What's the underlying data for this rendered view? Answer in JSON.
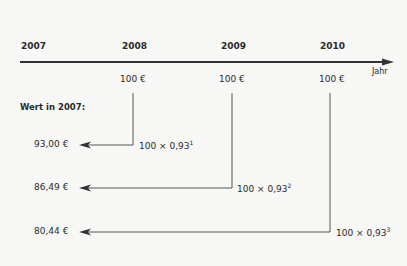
{
  "timeline": {
    "axis_label": "Jahr",
    "years": [
      "2007",
      "2008",
      "2009",
      "2010"
    ],
    "payments": [
      "100 €",
      "100 €",
      "100 €"
    ]
  },
  "present_value": {
    "heading": "Wert in 2007:",
    "values": [
      "93,00 €",
      "86,49 €",
      "80,44 €"
    ],
    "formulas": [
      {
        "base": "100 × 0,93",
        "exp": "1"
      },
      {
        "base": "100 × 0,93",
        "exp": "2"
      },
      {
        "base": "100 × 0,93",
        "exp": "3"
      }
    ]
  },
  "colors": {
    "line": "#333333",
    "text": "#2a2a2a",
    "background": "#f7f7f5"
  }
}
